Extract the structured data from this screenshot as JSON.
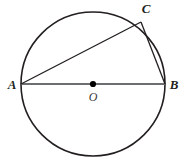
{
  "figure": {
    "background_color": "#ffffff",
    "width": 184,
    "height": 166
  },
  "style": {
    "circle_stroke": "#231f20",
    "circle_stroke_width": 1.6,
    "circle_fill": "none",
    "chord_stroke": "#231f20",
    "chord_stroke_width": 1.3,
    "diameter_stroke": "#6d6e71",
    "diameter_stroke_width": 2.2,
    "center_dot_fill": "#000000",
    "center_dot_radius": 3.1,
    "label_color": "#231f20",
    "center_label_color": "#3a3a3a"
  },
  "circle": {
    "name": "circle-o",
    "cx": 93,
    "cy": 84,
    "r": 72
  },
  "points": [
    {
      "id": "A",
      "label": "A",
      "x": 21,
      "y": 84,
      "label_x": 12,
      "label_y": 89,
      "anchor": "middle",
      "on_circle": true
    },
    {
      "id": "B",
      "label": "B",
      "x": 165,
      "y": 84,
      "label_x": 174,
      "label_y": 89,
      "anchor": "middle",
      "on_circle": true
    },
    {
      "id": "C",
      "label": "C",
      "x": 141,
      "y": 22,
      "label_x": 146,
      "label_y": 13,
      "anchor": "middle",
      "on_circle": true
    }
  ],
  "center": {
    "id": "O",
    "label": "O",
    "x": 93,
    "y": 84,
    "label_x": 93,
    "label_y": 101,
    "anchor": "middle",
    "marker": "filled-dot"
  },
  "segments": [
    {
      "id": "AB",
      "name": "diameter-a-b",
      "from": "A",
      "to": "B",
      "x1": 21,
      "y1": 84,
      "x2": 165,
      "y2": 84,
      "kind": "diameter"
    },
    {
      "id": "AC",
      "name": "chord-a-c",
      "from": "A",
      "to": "C",
      "x1": 21,
      "y1": 84,
      "x2": 141,
      "y2": 22,
      "kind": "chord"
    },
    {
      "id": "CB",
      "name": "chord-c-b",
      "from": "C",
      "to": "B",
      "x1": 141,
      "y1": 22,
      "x2": 165,
      "y2": 84,
      "kind": "chord"
    }
  ]
}
